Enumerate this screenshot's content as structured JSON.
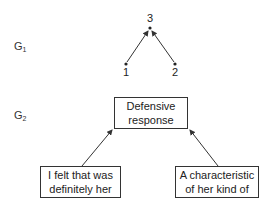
{
  "graphs": {
    "g1": {
      "label_main": "G",
      "label_sub": "1",
      "nodes": [
        {
          "id": "3",
          "label": "3"
        },
        {
          "id": "1",
          "label": "1"
        },
        {
          "id": "2",
          "label": "2"
        }
      ],
      "edges": [
        {
          "from": "1",
          "to": "3"
        },
        {
          "from": "2",
          "to": "3"
        }
      ]
    },
    "g2": {
      "label_main": "G",
      "label_sub": "2",
      "nodes": {
        "top": {
          "line1": "Defensive",
          "line2": "response"
        },
        "left": {
          "line1": "I felt that was",
          "line2": "definitely her"
        },
        "right": {
          "line1": "A characteristic",
          "line2": "of her kind of"
        }
      },
      "edges": [
        {
          "from": "left",
          "to": "top"
        },
        {
          "from": "right",
          "to": "top"
        }
      ]
    }
  }
}
